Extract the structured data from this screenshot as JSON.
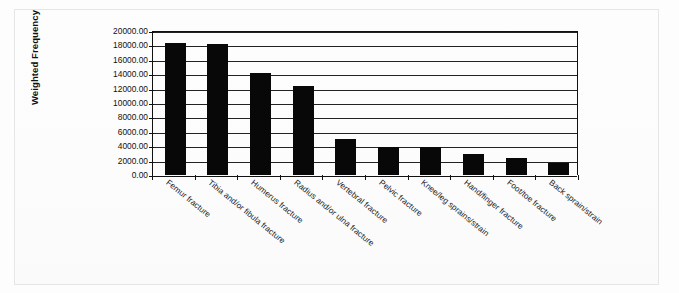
{
  "chart_data": {
    "type": "bar",
    "title": "",
    "subtitle": "",
    "xlabel": "",
    "ylabel": "Weighted Frequency",
    "ylim": [
      0,
      20000
    ],
    "ytick_step": 2000,
    "grid": true,
    "legend": false,
    "bar_color": "#080808",
    "categories": [
      "Femur fracture",
      "Tibia and/or fibula fracture",
      "Humerus fracture",
      "Radius and/or ulna fracture",
      "Vertebral fracture",
      "Pelvic fracture",
      "Knee/leg sprains/strain",
      "Hand/finger fracture",
      "Foot/toe fracture",
      "Back sprain/strain"
    ],
    "values": [
      18300,
      18200,
      14200,
      12300,
      5000,
      3900,
      3900,
      2900,
      2400,
      1600
    ],
    "ytick_labels": [
      "20000.00",
      "18000.00",
      "16000.00",
      "14000.00",
      "12000.00",
      "10000.00",
      "8000.00",
      "6000.00",
      "4000.00",
      "2000.00",
      "0.00"
    ],
    "ytick_values": [
      20000,
      18000,
      16000,
      14000,
      12000,
      10000,
      8000,
      6000,
      4000,
      2000,
      0
    ]
  }
}
